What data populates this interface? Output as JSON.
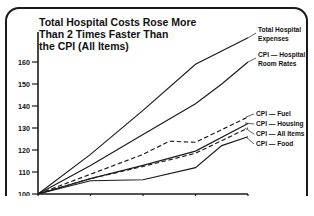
{
  "chart_data": {
    "type": "line",
    "title": "Total Hospital Costs Rose More Than 2 Times Faster Than the CPI (All Items)",
    "title_lines": [
      "Total Hospital Costs Rose More",
      "Than 2 Times Faster Than",
      "the CPI (All Items)"
    ],
    "xlabel": "",
    "ylabel": "",
    "x": [
      1974,
      1975,
      1976,
      1977,
      1978
    ],
    "xtick_labels": [
      "1974",
      "1975",
      "1976",
      "1977",
      "1978"
    ],
    "ytick_labels": [
      "100",
      "110",
      "120",
      "130",
      "140",
      "150",
      "160"
    ],
    "yticks": [
      100,
      110,
      120,
      130,
      140,
      150,
      160
    ],
    "ylim": [
      100,
      172
    ],
    "xlim": [
      1974,
      1978
    ],
    "grid": false,
    "legend_position": "right-inline-labels",
    "series": [
      {
        "name": "Total Hospital Expenses",
        "label_lines": [
          "Total Hospital",
          "Expenses"
        ],
        "style": "solid",
        "x": [
          1974,
          1975,
          1976,
          1977,
          1978
        ],
        "values": [
          100,
          118,
          138,
          159,
          171
        ]
      },
      {
        "name": "CPI — Hospital Room Rates",
        "label_lines": [
          "CPI — Hospital",
          "Room Rates"
        ],
        "style": "solid",
        "x": [
          1974,
          1975,
          1976,
          1977,
          1977.5,
          1978
        ],
        "values": [
          100,
          113,
          127,
          141,
          150,
          160
        ]
      },
      {
        "name": "CPI — Fuel",
        "label_lines": [
          "CPI — Fuel"
        ],
        "style": "dashed",
        "x": [
          1974,
          1975,
          1976,
          1976.5,
          1977,
          1978
        ],
        "values": [
          100,
          109,
          118,
          124,
          123.5,
          135
        ]
      },
      {
        "name": "CPI — Housing",
        "label_lines": [
          "CPI — Housing"
        ],
        "style": "solid",
        "x": [
          1974,
          1975,
          1976,
          1977,
          1978
        ],
        "values": [
          100,
          107,
          113,
          119.5,
          132
        ]
      },
      {
        "name": "CPI — All Items",
        "label_lines": [
          "CPI — All Items"
        ],
        "style": "dashed",
        "x": [
          1974,
          1975,
          1976,
          1977,
          1978
        ],
        "values": [
          100,
          107,
          112.5,
          118.5,
          130
        ]
      },
      {
        "name": "CPI — Food",
        "label_lines": [
          "CPI — Food"
        ],
        "style": "solid",
        "x": [
          1974,
          1975,
          1976,
          1977,
          1977.5,
          1978
        ],
        "values": [
          100,
          106,
          106.5,
          112,
          122,
          126
        ]
      }
    ],
    "colors": {
      "line": "#1a1a1a",
      "axis": "#1a1a1a",
      "text": "#111111",
      "background": "#ffffff"
    }
  }
}
